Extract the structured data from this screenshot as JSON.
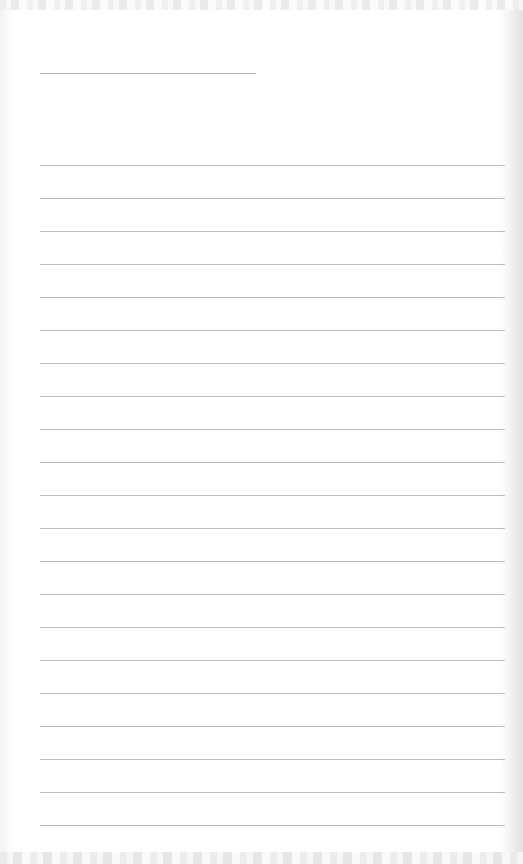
{
  "document": {
    "type": "blank lined paper",
    "title_line": {
      "present": true
    },
    "ruled_lines": {
      "count": 21,
      "first_y": 165,
      "spacing": 33,
      "color": "#bdbdbd"
    },
    "text": ""
  }
}
